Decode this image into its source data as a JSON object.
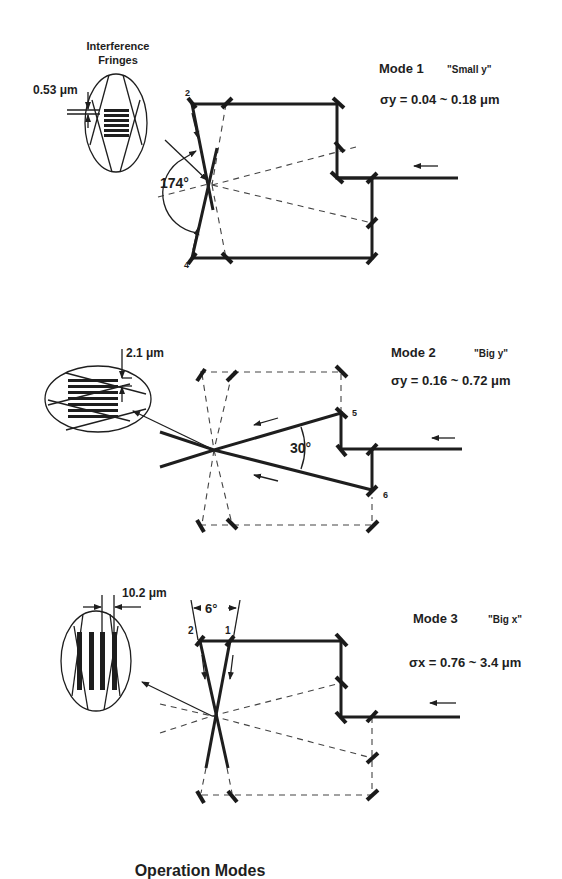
{
  "figure": {
    "title": "Operation Modes"
  },
  "modes": [
    {
      "name": "Mode 1",
      "nickname": "\"Small y\"",
      "sigma_label": "σy = 0.04 ~ 0.18 μm",
      "inset_title_line1": "Interference",
      "inset_title_line2": "Fringes",
      "fringe_spacing": "0.53 μm",
      "crossing_angle": "174°",
      "mirror_labels": [
        "2",
        "4"
      ]
    },
    {
      "name": "Mode 2",
      "nickname": "\"Big y\"",
      "sigma_label": "σy = 0.16 ~ 0.72 μm",
      "fringe_spacing": "2.1 μm",
      "crossing_angle": "30°",
      "mirror_labels": [
        "5",
        "6"
      ]
    },
    {
      "name": "Mode 3",
      "nickname": "\"Big x\"",
      "sigma_label": "σx = 0.76 ~ 3.4 μm",
      "fringe_spacing": "10.2 μm",
      "crossing_angle": "6°",
      "mirror_labels": [
        "2",
        "1"
      ]
    }
  ]
}
